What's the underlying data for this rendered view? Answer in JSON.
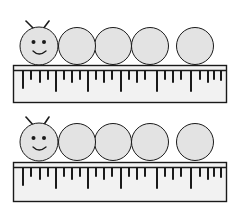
{
  "worksheet": {
    "description": "Two caterpillars measured against rulers",
    "colors": {
      "body_fill": "#e3e3e3",
      "outline": "#1a1a1a",
      "ruler_fill": "#f2f2f2",
      "background": "#ffffff"
    },
    "items": [
      {
        "id": "caterpillar-1",
        "segments": 5,
        "has_face": true,
        "ruler_ticks": 32
      },
      {
        "id": "caterpillar-2",
        "segments": 5,
        "has_face": true,
        "ruler_ticks": 32
      }
    ]
  }
}
